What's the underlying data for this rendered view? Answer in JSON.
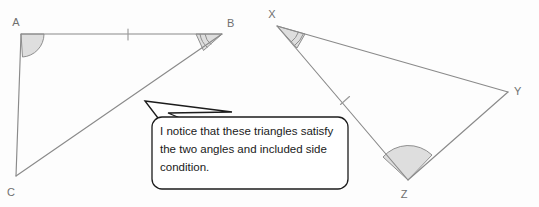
{
  "figure": {
    "background_color": "#fdfdfd",
    "stroke_color": "#8a8a8a",
    "angle_fill_color": "#d8d8d8",
    "bubble_stroke_color": "#1c1c1c",
    "label_color": "#6f6f6f"
  },
  "triangles": [
    {
      "name": "triangle-abc",
      "vertices": [
        {
          "label": "A",
          "x": 21,
          "y": 34,
          "label_x": 16,
          "label_y": 26
        },
        {
          "label": "B",
          "x": 222,
          "y": 34,
          "label_x": 227,
          "label_y": 27
        },
        {
          "label": "C",
          "x": 16,
          "y": 176,
          "label_x": 11,
          "label_y": 196
        }
      ],
      "angle_marks": [
        {
          "at": "A",
          "style": "wide-filled-arc",
          "radius": 23
        },
        {
          "at": "B",
          "style": "narrow-double-arc",
          "radius": 26
        }
      ],
      "side_ticks": [
        {
          "side": "AB",
          "count": 1,
          "x": 128,
          "y": 34
        }
      ]
    },
    {
      "name": "triangle-xyz",
      "vertices": [
        {
          "label": "X",
          "x": 277,
          "y": 26,
          "label_x": 272,
          "label_y": 18
        },
        {
          "label": "Y",
          "x": 508,
          "y": 92,
          "label_x": 514,
          "label_y": 95
        },
        {
          "label": "Z",
          "x": 408,
          "y": 180,
          "label_x": 404,
          "label_y": 198
        }
      ],
      "angle_marks": [
        {
          "at": "X",
          "style": "narrow-double-arc",
          "radius": 28
        },
        {
          "at": "Z",
          "style": "wide-filled-arc",
          "radius": 27
        }
      ],
      "side_ticks": [
        {
          "side": "XZ",
          "count": 1,
          "x": 345,
          "y": 100
        }
      ]
    }
  ],
  "callout": {
    "text": "I notice that these triangles satisfy the two angles and included side condition.",
    "lines": [
      "I notice that these triangles",
      "satisfy the two angles and",
      "included side condition."
    ],
    "x": 152,
    "y": 117,
    "width": 196,
    "height": 72,
    "tail_tip_x": 145,
    "tail_tip_y": 101
  }
}
